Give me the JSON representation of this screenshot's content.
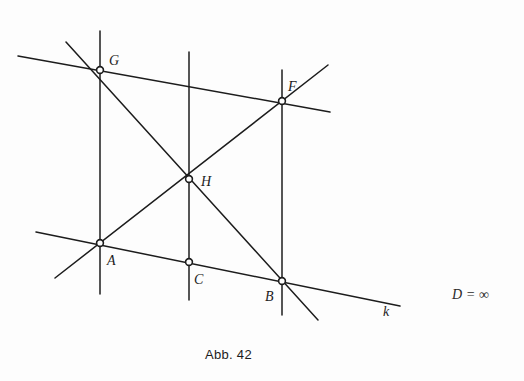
{
  "figure": {
    "caption": "Abb. 42",
    "caption_x": 205,
    "caption_y": 347,
    "background_color": "#fdfdfd",
    "ink_color": "#1c1c1c",
    "annotation": {
      "symbol": "D",
      "relation": " = ",
      "value": "∞",
      "full_text": "D = ∞",
      "x": 452,
      "y": 287
    },
    "points": [
      {
        "id": "G",
        "label": "G",
        "x": 100,
        "y": 70,
        "label_dx": 9,
        "label_dy": -5,
        "marker": "open-circle"
      },
      {
        "id": "F",
        "label": "F",
        "x": 282,
        "y": 101,
        "label_dx": 6,
        "label_dy": -10,
        "marker": "open-circle"
      },
      {
        "id": "H",
        "label": "H",
        "x": 189,
        "y": 179,
        "label_dx": 12,
        "label_dy": 7,
        "marker": "open-circle"
      },
      {
        "id": "A",
        "label": "A",
        "x": 100,
        "y": 243,
        "label_dx": 7,
        "label_dy": 22,
        "marker": "open-circle"
      },
      {
        "id": "C",
        "label": "C",
        "x": 189,
        "y": 262,
        "label_dx": 5,
        "label_dy": 22,
        "marker": "open-circle"
      },
      {
        "id": "B",
        "label": "B",
        "x": 282,
        "y": 281,
        "label_dx": -17,
        "label_dy": 20,
        "marker": "open-circle"
      }
    ],
    "lines": [
      {
        "id": "vertical-GA",
        "name": "vertical-line-through-G-and-A",
        "x1": 100,
        "y1": 31,
        "x2": 100,
        "y2": 294
      },
      {
        "id": "vertical-HC",
        "name": "vertical-line-through-H-and-C",
        "x1": 189,
        "y1": 52,
        "x2": 189,
        "y2": 300
      },
      {
        "id": "vertical-FB",
        "name": "vertical-line-through-F-and-B",
        "x1": 282,
        "y1": 70,
        "x2": 282,
        "y2": 315
      },
      {
        "id": "line-GF",
        "name": "line-through-G-and-F",
        "x1": 18,
        "y1": 56,
        "x2": 330,
        "y2": 112
      },
      {
        "id": "line-k",
        "name": "line-k-through-A-C-B",
        "x1": 36,
        "y1": 232,
        "x2": 400,
        "y2": 306
      },
      {
        "id": "diag-GHB",
        "name": "diagonal-through-G-H-B",
        "x1": 66,
        "y1": 42,
        "x2": 318,
        "y2": 320
      },
      {
        "id": "diag-AHF",
        "name": "diagonal-through-A-H-F",
        "x1": 55,
        "y1": 278,
        "x2": 328,
        "y2": 65
      }
    ],
    "line_labels": [
      {
        "id": "k",
        "label": "k",
        "x": 383,
        "y": 316
      }
    ]
  }
}
